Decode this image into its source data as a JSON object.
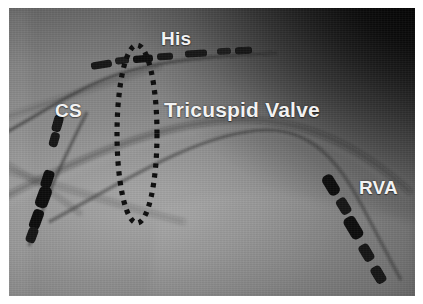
{
  "figure": {
    "modality": "fluoroscopy",
    "background_color": "#8d8d8d",
    "frame_color": "#ffffff"
  },
  "annotations": {
    "label_color": "#f2f2f2",
    "items": [
      {
        "id": "his",
        "text": "His",
        "name": "his-bundle-label"
      },
      {
        "id": "cs",
        "text": "CS",
        "name": "coronary-sinus-label"
      },
      {
        "id": "tricuspid",
        "text": "Tricuspid Valve",
        "name": "tricuspid-valve-label"
      },
      {
        "id": "rva",
        "text": "RVA",
        "name": "right-ventricular-apex-label"
      }
    ]
  },
  "overlays": {
    "annulus_ellipse": {
      "name": "tricuspid-annulus-ellipse",
      "style": "dotted",
      "dot_color": "#0d0d0d",
      "center_x": 136,
      "center_y": 126,
      "radius_x": 20,
      "radius_y": 89,
      "dot_count": 62
    }
  },
  "catheters": [
    {
      "id": "his",
      "name": "his-catheter",
      "label": "His",
      "electrode_count": 8,
      "color": "#1a1a1a"
    },
    {
      "id": "cs",
      "name": "coronary-sinus-catheter",
      "label": "CS",
      "electrode_count": 6,
      "color": "#141414"
    },
    {
      "id": "rva",
      "name": "rva-catheter",
      "label": "RVA",
      "electrode_count": 5,
      "color": "#171717"
    }
  ]
}
